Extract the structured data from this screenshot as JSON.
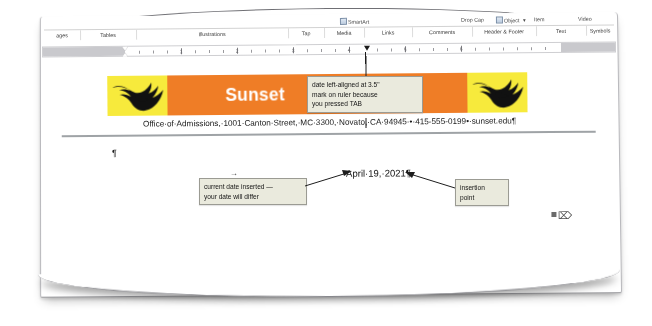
{
  "app": {
    "name": "Microsoft Word",
    "view": "print-layout"
  },
  "ribbon": {
    "commands": [
      {
        "label": "SmartArt",
        "icon": "smartart-icon"
      },
      {
        "label": "Item",
        "icon": "none"
      },
      {
        "label": "Video",
        "icon": "none"
      },
      {
        "label": "Drop Cap",
        "icon": "drop-cap-icon"
      },
      {
        "label": "Object",
        "icon": "object-icon"
      }
    ],
    "groups": [
      {
        "label": "ages"
      },
      {
        "label": "Tables"
      },
      {
        "label": "Illustrations"
      },
      {
        "label": "Tap"
      },
      {
        "label": "Media"
      },
      {
        "label": "Links"
      },
      {
        "label": "Comments"
      },
      {
        "label": "Header & Footer"
      },
      {
        "label": "Text"
      },
      {
        "label": "Symbols"
      }
    ]
  },
  "ruler": {
    "numbers": [
      "1",
      "2",
      "3",
      "4",
      "5",
      "6"
    ],
    "tab_stop_position": "3.5\"",
    "unit": "inches"
  },
  "document": {
    "banner": {
      "title_visible": "Sunset",
      "title_tail": "ege",
      "paragraph_mark": "¶",
      "background_color": "#ef7d26",
      "wing_color": "#f7ea3c",
      "logo_icon": "eagle-logo-icon",
      "title_color": "#ffffff"
    },
    "address_line": "Office·of·Admissions,·1001·Canton·Street,·MC·3300,·Novato,·CA·94945·•·415-555-0199•·sunset.edu¶",
    "empty_paragraph_mark": "¶",
    "tab_mark": "→",
    "date_text": "April·19,·2021¶",
    "cursor_icon": "i-beam-cursor"
  },
  "callouts": [
    {
      "name": "tab-alignment-callout",
      "lines": [
        "date left-aligned at 3.5\"",
        "mark on ruler because",
        "you pressed TAB"
      ]
    },
    {
      "name": "current-date-callout",
      "lines": [
        "current date inserted —",
        "your date will differ"
      ]
    },
    {
      "name": "insertion-point-callout",
      "lines": [
        "insertion",
        "point"
      ]
    }
  ],
  "colors": {
    "banner_orange": "#ef7d26",
    "banner_yellow": "#f7ea3c",
    "callout_fill": "#eaeadd",
    "callout_border": "#9b9b93"
  }
}
